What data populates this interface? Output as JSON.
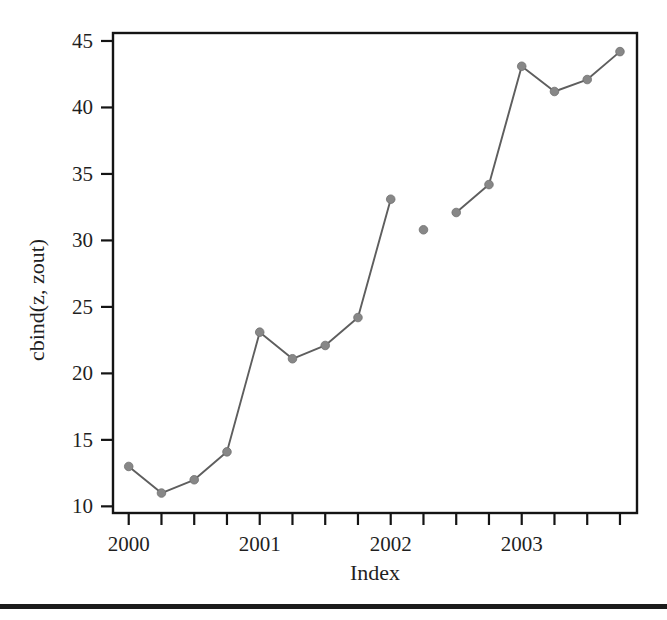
{
  "figure": {
    "background_color": "#ffffff",
    "frame_color": "#141414",
    "marker_color": "#878787",
    "line_color": "#5e5e5e"
  },
  "chart_data": {
    "type": "line",
    "title": "",
    "xlabel": "Index",
    "ylabel": "cbind(z, zout)",
    "xlim": [
      1999.88,
      2003.88
    ],
    "ylim": [
      9.5,
      45.6
    ],
    "grid": false,
    "legend": null,
    "x_tick_labels": [
      "2000",
      "2001",
      "2002",
      "2003"
    ],
    "x_tick_values": [
      2000,
      2001,
      2002,
      2003
    ],
    "x_minor_ticks": [
      2000,
      2000.25,
      2000.5,
      2000.75,
      2001,
      2001.25,
      2001.5,
      2001.75,
      2002,
      2002.25,
      2002.5,
      2002.75,
      2003,
      2003.25,
      2003.5,
      2003.75
    ],
    "y_tick_labels": [
      "10",
      "15",
      "20",
      "25",
      "30",
      "35",
      "40",
      "45"
    ],
    "y_tick_values": [
      10,
      15,
      20,
      25,
      30,
      35,
      40,
      45
    ],
    "x": [
      2000,
      2000.25,
      2000.5,
      2000.75,
      2001,
      2001.25,
      2001.5,
      2001.75,
      2002,
      2002.25,
      2002.5,
      2002.75,
      2003,
      2003.25,
      2003.5,
      2003.75
    ],
    "series": [
      {
        "name": "z",
        "marker": "filled-circle",
        "connected": true,
        "x": [
          2000,
          2000.25,
          2000.5,
          2000.75,
          2001,
          2001.25,
          2001.5,
          2001.75,
          2002
        ],
        "values": [
          13.0,
          11.0,
          12.0,
          14.1,
          23.1,
          21.1,
          22.1,
          24.2,
          33.1
        ]
      },
      {
        "name": "zout",
        "marker": "filled-circle",
        "connected": false,
        "x": [
          2002.25
        ],
        "values": [
          30.8
        ]
      },
      {
        "name": "z-continued",
        "marker": "filled-circle",
        "connected": true,
        "x": [
          2002.5,
          2002.75,
          2003,
          2003.25,
          2003.5,
          2003.75
        ],
        "values": [
          32.1,
          34.2,
          43.1,
          41.2,
          42.1,
          44.2
        ]
      }
    ]
  },
  "artifacts": {
    "scan_rule_label": "scan-edge-rule"
  }
}
